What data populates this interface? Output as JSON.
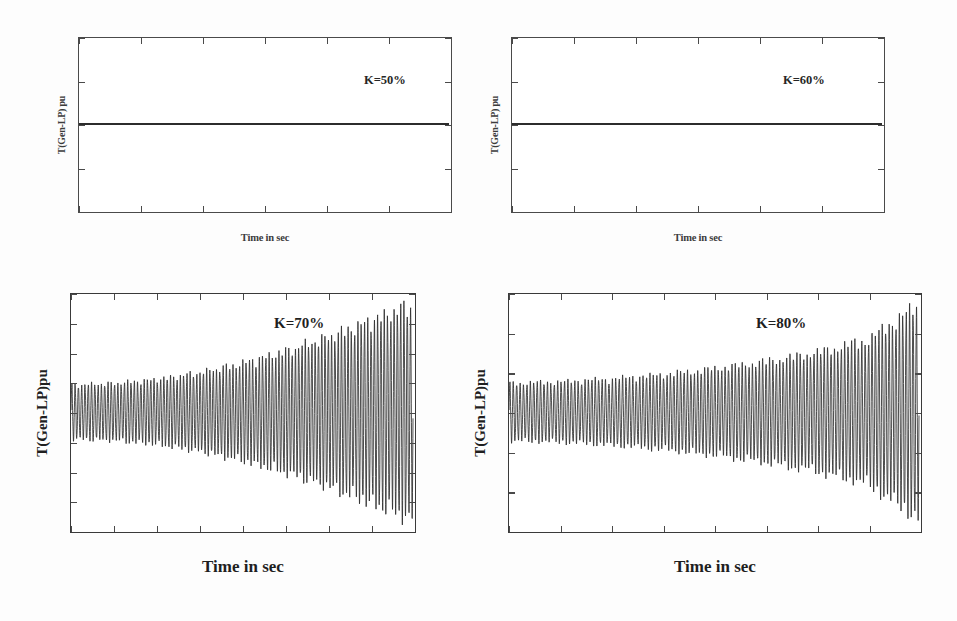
{
  "figure": {
    "background": "#ffffff",
    "trace_color": "#2c2c2c",
    "axis_color": "#4a4a4a"
  },
  "chart_data": [
    {
      "id": "k50",
      "type": "line",
      "title": "",
      "annotation": "K=50%",
      "xlabel": "Time in sec",
      "ylabel": "T(Gen-LP) pu",
      "xlim": [
        0,
        6
      ],
      "ylim": [
        -4,
        4
      ],
      "xticks": [
        "0",
        "1",
        "2",
        "3",
        "4",
        "5",
        "6"
      ],
      "xtick_values": [
        0,
        1,
        2,
        3,
        4,
        5,
        6
      ],
      "yticks": [
        "4",
        "2",
        "0",
        "-2",
        "-4"
      ],
      "ytick_values": [
        4,
        2,
        0,
        -2,
        -4
      ],
      "grid": false,
      "legend": "none",
      "description": "Flat zero-amplitude torque trace; stable, fully damped response at 50% series compensation.",
      "series": [
        {
          "name": "T(Gen-LP)",
          "envelope_model": "constant-zero",
          "amplitude_at": [
            {
              "x": 0,
              "y": 0
            },
            {
              "x": 1,
              "y": 0
            },
            {
              "x": 2,
              "y": 0
            },
            {
              "x": 3,
              "y": 0
            },
            {
              "x": 4,
              "y": 0
            },
            {
              "x": 5,
              "y": 0
            },
            {
              "x": 6,
              "y": 0
            }
          ]
        }
      ]
    },
    {
      "id": "k60",
      "type": "line",
      "title": "",
      "annotation": "K=60%",
      "xlabel": "Time in sec",
      "ylabel": "T(Gen-LP) pu",
      "xlim": [
        0,
        6
      ],
      "ylim": [
        -4,
        4
      ],
      "xticks": [
        "0",
        "1",
        "2",
        "3",
        "4",
        "5",
        "6"
      ],
      "xtick_values": [
        0,
        1,
        2,
        3,
        4,
        5,
        6
      ],
      "yticks": [
        "4",
        "2",
        "0",
        "-2",
        "-4"
      ],
      "ytick_values": [
        4,
        2,
        0,
        -2,
        -4
      ],
      "grid": false,
      "legend": "none",
      "description": "Flat zero-amplitude torque trace; stable, fully damped response at 60% series compensation.",
      "series": [
        {
          "name": "T(Gen-LP)",
          "envelope_model": "constant-zero",
          "amplitude_at": [
            {
              "x": 0,
              "y": 0
            },
            {
              "x": 1,
              "y": 0
            },
            {
              "x": 2,
              "y": 0
            },
            {
              "x": 3,
              "y": 0
            },
            {
              "x": 4,
              "y": 0
            },
            {
              "x": 5,
              "y": 0
            },
            {
              "x": 6,
              "y": 0
            }
          ]
        }
      ]
    },
    {
      "id": "k70",
      "type": "line",
      "title": "",
      "annotation": "K=70%",
      "xlabel": "Time in sec",
      "ylabel": "T(Gen-LP)pu",
      "xlim": [
        0,
        40
      ],
      "ylim": [
        -20,
        20
      ],
      "xticks": [
        "0",
        "5",
        "10",
        "15",
        "20",
        "25",
        "30",
        "35",
        "40"
      ],
      "xtick_values": [
        0,
        5,
        10,
        15,
        20,
        25,
        30,
        35,
        40
      ],
      "yticks": [
        "20",
        "15",
        "10",
        "5",
        "0",
        "-5",
        "-10",
        "-15",
        "-20"
      ],
      "ytick_values": [
        20,
        15,
        10,
        5,
        0,
        -5,
        -10,
        -15,
        -20
      ],
      "grid": false,
      "legend": "none",
      "description": "Growing subsynchronous torsional oscillation; envelope expands from about 5 pu to 20 pu over 40 s at 70% series compensation.",
      "series": [
        {
          "name": "T(Gen-LP)",
          "envelope_model": "exponential-growth",
          "carrier_hz": 2.6,
          "beat_hz": 0.22,
          "envelope_at": [
            {
              "x": 0,
              "y": 5.0
            },
            {
              "x": 5,
              "y": 5.3
            },
            {
              "x": 10,
              "y": 6.0
            },
            {
              "x": 15,
              "y": 7.3
            },
            {
              "x": 20,
              "y": 9.0
            },
            {
              "x": 25,
              "y": 11.2
            },
            {
              "x": 30,
              "y": 13.8
            },
            {
              "x": 35,
              "y": 16.8
            },
            {
              "x": 40,
              "y": 20.0
            }
          ]
        }
      ]
    },
    {
      "id": "k80",
      "type": "line",
      "title": "",
      "annotation": "K=80%",
      "xlabel": "Time in sec",
      "ylabel": "T(Gen-LP)pu",
      "xlim": [
        0,
        40
      ],
      "ylim": [
        -30,
        30
      ],
      "xticks": [
        "0",
        "5",
        "10",
        "15",
        "20",
        "25",
        "30",
        "35",
        "40"
      ],
      "xtick_values": [
        0,
        5,
        10,
        15,
        20,
        25,
        30,
        35,
        40
      ],
      "yticks": [
        "30",
        "20",
        "10",
        "0",
        "-10",
        "-20",
        "-30"
      ],
      "ytick_values": [
        30,
        20,
        10,
        0,
        -10,
        -20,
        -30
      ],
      "grid": false,
      "legend": "none",
      "description": "Unstable growing torsional oscillation; envelope expands from about 8 pu to nearly 30 pu with sharp divergence near 38-40 s at 80% series compensation.",
      "series": [
        {
          "name": "T(Gen-LP)",
          "envelope_model": "exponential-growth",
          "carrier_hz": 3.0,
          "beat_hz": 0.18,
          "envelope_at": [
            {
              "x": 0,
              "y": 8.0
            },
            {
              "x": 5,
              "y": 8.4
            },
            {
              "x": 10,
              "y": 9.2
            },
            {
              "x": 15,
              "y": 10.4
            },
            {
              "x": 20,
              "y": 12.0
            },
            {
              "x": 25,
              "y": 14.0
            },
            {
              "x": 30,
              "y": 16.5
            },
            {
              "x": 35,
              "y": 20.0
            },
            {
              "x": 38,
              "y": 26.0
            },
            {
              "x": 40,
              "y": 29.5
            }
          ]
        }
      ]
    }
  ]
}
